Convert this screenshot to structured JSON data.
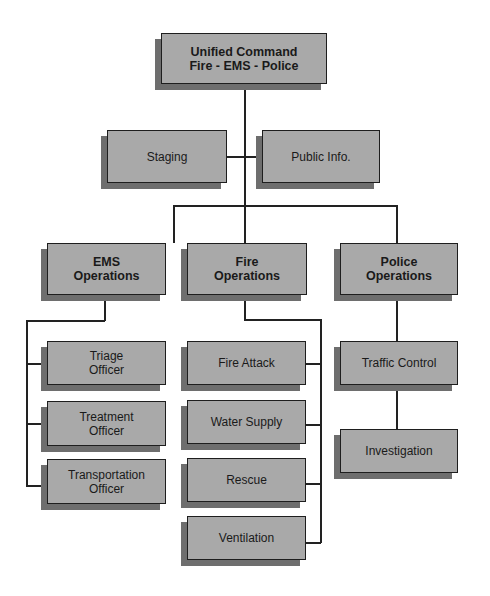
{
  "diagram": {
    "root": {
      "label": "Unified Command\nFire - EMS - Police"
    },
    "staff": [
      {
        "label": "Staging"
      },
      {
        "label": "Public Info."
      }
    ],
    "sections": [
      {
        "label": "EMS\nOperations",
        "children": [
          {
            "label": "Triage\nOfficer"
          },
          {
            "label": "Treatment\nOfficer"
          },
          {
            "label": "Transportation\nOfficer"
          }
        ]
      },
      {
        "label": "Fire\nOperations",
        "children": [
          {
            "label": "Fire Attack"
          },
          {
            "label": "Water Supply"
          },
          {
            "label": "Rescue"
          },
          {
            "label": "Ventilation"
          }
        ]
      },
      {
        "label": "Police\nOperations",
        "children": [
          {
            "label": "Traffic Control"
          },
          {
            "label": "Investigation"
          }
        ]
      }
    ]
  },
  "colors": {
    "box_fill": "#a9a9a9",
    "box_shadow": "#6e6e6e",
    "line": "#222222"
  }
}
